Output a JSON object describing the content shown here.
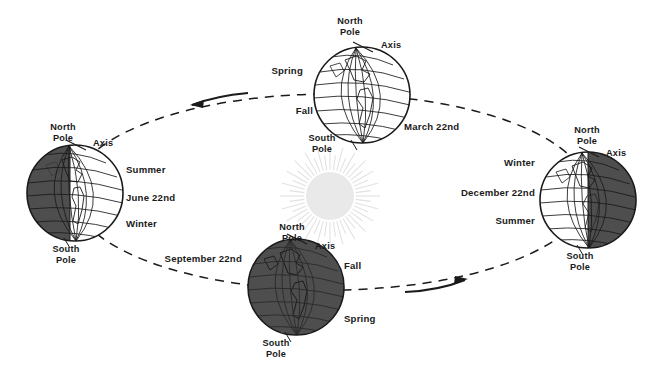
{
  "figure": {
    "background_color": "#ffffff",
    "ink_color": "#1a1a1a",
    "sun_color": "#e8e8e8",
    "night_color": "#4a4a4a"
  },
  "sun": {
    "name": "Sun",
    "ray_count": 48
  },
  "orbit": {
    "style": "dashed-ellipse",
    "direction_arrows": [
      {
        "label": "counterclockwise-arrow-top-left",
        "direction": "left"
      },
      {
        "label": "counterclockwise-arrow-bottom-right",
        "direction": "right"
      }
    ]
  },
  "positions": [
    {
      "id": "june",
      "date": "June 22nd",
      "lit_side": "right",
      "pole_top": "North\nPole",
      "pole_top_line1": "North",
      "pole_top_line2": "Pole",
      "pole_bottom_line1": "South",
      "pole_bottom_line2": "Pole",
      "axis": "Axis",
      "season_upper": "Summer",
      "season_lower": "Winter"
    },
    {
      "id": "september",
      "date": "September 22nd",
      "lit_side": "none",
      "pole_top_line1": "North",
      "pole_top_line2": "Pole",
      "pole_bottom_line1": "South",
      "pole_bottom_line2": "Pole",
      "axis": "Axis",
      "season_upper": "Fall",
      "season_lower": "Spring"
    },
    {
      "id": "december",
      "date": "December 22nd",
      "lit_side": "left",
      "pole_top_line1": "North",
      "pole_top_line2": "Pole",
      "pole_bottom_line1": "South",
      "pole_bottom_line2": "Pole",
      "axis": "Axis",
      "season_upper": "Winter",
      "season_lower": "Summer"
    },
    {
      "id": "march",
      "date": "March 22nd",
      "lit_side": "full",
      "pole_top_line1": "North",
      "pole_top_line2": "Pole",
      "pole_bottom_line1": "South",
      "pole_bottom_line2": "Pole",
      "axis": "Axis",
      "season_upper": "Spring",
      "season_lower": "Fall"
    }
  ]
}
